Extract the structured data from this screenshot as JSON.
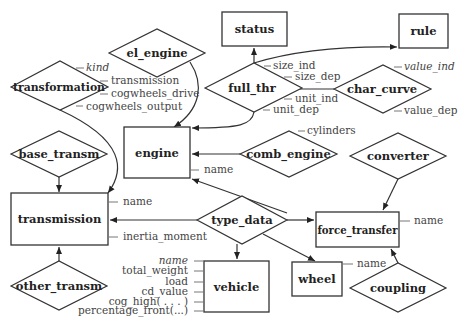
{
  "entities": {
    "status": "status",
    "rule": "rule",
    "engine": "engine",
    "transmission": "transmission",
    "force_transfer": "force_transfer",
    "vehicle": "vehicle",
    "wheel": "wheel"
  },
  "relationships": {
    "el_engine": "el_engine",
    "transformation": "transformation",
    "full_thr": "full_thr",
    "char_curve": "char_curve",
    "comb_engine": "comb_engine",
    "converter": "converter",
    "base_transm": "base_transm",
    "type_data": "type_data",
    "other_transm": "other_transm",
    "coupling": "coupling"
  },
  "attributes": {
    "transformation": [
      {
        "text": "kind",
        "italic": true
      },
      {
        "text": "transmission",
        "italic": false
      },
      {
        "text": "cogwheels_drive",
        "italic": false
      },
      {
        "text": "cogwheels_output",
        "italic": false
      }
    ],
    "full_thr": [
      "size_ind",
      "size_dep",
      "unit_ind",
      "unit_dep"
    ],
    "char_curve": [
      {
        "text": "value_ind",
        "italic": true
      },
      {
        "text": "value_dep",
        "italic": false
      }
    ],
    "comb_engine": [
      "cylinders"
    ],
    "engine": [
      "name"
    ],
    "transmission": [
      "name",
      "inertia_moment"
    ],
    "force_transfer": [
      "name"
    ],
    "wheel": [
      "name"
    ],
    "vehicle": [
      {
        "text": "name",
        "italic": true
      },
      {
        "text": "total_weight",
        "italic": false
      },
      {
        "text": "load",
        "italic": false
      },
      {
        "text": "cd_value",
        "italic": false
      },
      {
        "text": "cog_high( . . . )",
        "italic": false
      },
      {
        "text": "percentage_front(...)",
        "italic": false
      }
    ]
  }
}
